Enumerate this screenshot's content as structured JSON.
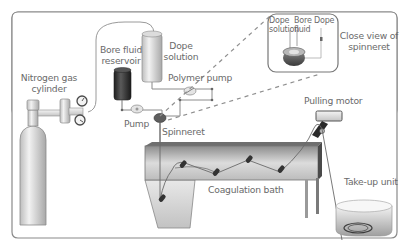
{
  "diagram": {
    "labels": {
      "nitrogen": [
        "Nitrogen gas",
        "cylinder"
      ],
      "bore_reservoir": [
        "Bore fluid",
        "reservoir"
      ],
      "dope_solution": [
        "Dope",
        "solution"
      ],
      "polymer_pump": "Polymer pump",
      "pump": "Pump",
      "spinneret": "Spinneret",
      "close_view": [
        "Close view of",
        "spinneret"
      ],
      "inset_dope_left": [
        "Dope",
        "solution"
      ],
      "inset_bore": [
        "Bore",
        "fluid"
      ],
      "inset_dope_right": "Dope",
      "pulling_motor": "Pulling motor",
      "coagulation_bath": "Coagulation bath",
      "take_up_unit": "Take-up unit"
    },
    "colors": {
      "frame": "#8a8a8a",
      "text": "#6a6a6a",
      "dashed": "#8f8f8f",
      "metal_light": "#e6e6e6",
      "metal_dark": "#9a9a9a",
      "reservoir_dark": "#2f2f2f"
    }
  }
}
